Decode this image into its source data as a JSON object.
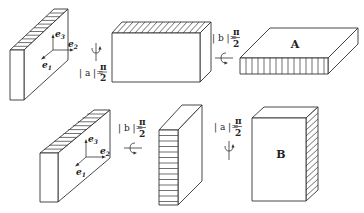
{
  "diagram": {
    "top_row": {
      "box1": {
        "basis": [
          "e1",
          "e2",
          "e3"
        ],
        "hatched_face": "top"
      },
      "rotation1": {
        "variable": "a",
        "label_lhs": "| a |=",
        "numerator": "π",
        "denominator": "2",
        "axis": "vertical"
      },
      "box2": {
        "hatched_face": "top"
      },
      "rotation2": {
        "variable": "b",
        "label_lhs": "| b |=",
        "numerator": "π",
        "denominator": "2",
        "axis": "horizontal"
      },
      "box3": {
        "label": "A",
        "hatched_face": "front"
      }
    },
    "bottom_row": {
      "box1": {
        "basis": [
          "e1",
          "e2",
          "e3"
        ],
        "hatched_face": "top"
      },
      "rotation1": {
        "variable": "b",
        "label_lhs": "| b |=",
        "numerator": "π",
        "denominator": "2",
        "axis": "horizontal"
      },
      "box2": {
        "hatched_face": "front"
      },
      "rotation2": {
        "variable": "a",
        "label_lhs": "| a |=",
        "numerator": "π",
        "denominator": "2",
        "axis": "vertical"
      },
      "box3": {
        "label": "B",
        "hatched_face": "right"
      }
    },
    "basis_labels": {
      "e": "e",
      "s1": "1",
      "s2": "2",
      "s3": "3"
    },
    "colors": {
      "line": "#333333",
      "background": "#ffffff",
      "text": "#222222"
    }
  }
}
